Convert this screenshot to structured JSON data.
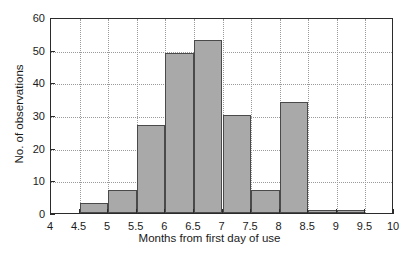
{
  "chart_data": {
    "type": "bar",
    "title": "",
    "xlabel": "Months from first day of use",
    "ylabel": "No. of observations",
    "xlim": [
      4,
      10
    ],
    "ylim": [
      0,
      60
    ],
    "grid": true,
    "legend": false,
    "bin_width": 0.5,
    "bin_edges": [
      4,
      4.5,
      5,
      5.5,
      6,
      6.5,
      7,
      7.5,
      8,
      8.5,
      9,
      9.5,
      10
    ],
    "categories": [
      "4-4.5",
      "4.5-5",
      "5-5.5",
      "5.5-6",
      "6-6.5",
      "6.5-7",
      "7-7.5",
      "7.5-8",
      "8-8.5",
      "8.5-9",
      "9-9.5",
      "9.5-10"
    ],
    "values": [
      0,
      3,
      7,
      27,
      49,
      53,
      30,
      7,
      34,
      1,
      1,
      0
    ],
    "xticks": [
      "4",
      "4.5",
      "5",
      "5.5",
      "6",
      "6.5",
      "7",
      "7.5",
      "8",
      "8.5",
      "9",
      "9.5",
      "10"
    ],
    "xtick_values": [
      4,
      4.5,
      5,
      5.5,
      6,
      6.5,
      7,
      7.5,
      8,
      8.5,
      9,
      9.5,
      10
    ],
    "yticks": [
      "0",
      "10",
      "20",
      "30",
      "40",
      "50",
      "60"
    ],
    "ytick_values": [
      0,
      10,
      20,
      30,
      40,
      50,
      60
    ],
    "bar_color": "#a9a9a9",
    "bar_edge_color": "#4a4a4a",
    "grid_color": "#9a9a9a",
    "axis_color": "#2b2b2b"
  }
}
